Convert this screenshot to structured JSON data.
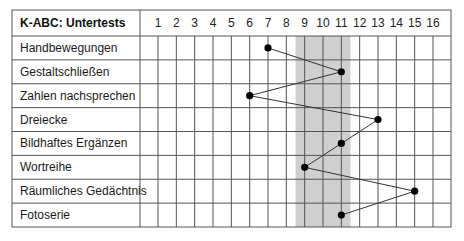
{
  "chart_data": {
    "type": "line",
    "title": "K-ABC: Untertests",
    "orientation": "profile-horizontal",
    "x_ticks": [
      1,
      2,
      3,
      4,
      5,
      6,
      7,
      8,
      9,
      10,
      11,
      12,
      13,
      14,
      15,
      16
    ],
    "xlim": [
      1,
      16
    ],
    "categories": [
      "Handbewegungen",
      "Gestaltschließen",
      "Zahlen nachsprechen",
      "Dreiecke",
      "Bildhaftes Ergänzen",
      "Wortreihe",
      "Räumliches Gedächtnis",
      "Fotoserie"
    ],
    "values": [
      7,
      11,
      6,
      13,
      11,
      9,
      15,
      11
    ],
    "shaded_band": {
      "from": 8.5,
      "to": 11.5,
      "color": "#cfcfcf"
    },
    "grid": true,
    "legend": null,
    "colors": {
      "line": "#333333",
      "marker": "#000000",
      "grid": "#555555",
      "band": "#cfcfcf"
    }
  },
  "header": {
    "title": "K-ABC: Untertests"
  }
}
